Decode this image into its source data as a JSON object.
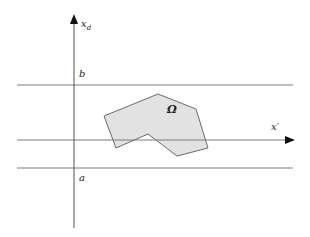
{
  "diagram": {
    "labels": {
      "vertical_axis": "x",
      "vertical_axis_sub": "d",
      "horizontal_axis": "x′",
      "upper_bound": "b",
      "lower_bound": "a",
      "region": "Ω"
    },
    "colors": {
      "line": "#7a7a7a",
      "axis": "#555555",
      "arrow": "#111111",
      "region_fill": "#e2e2e2",
      "region_stroke": "#6a6a6a"
    },
    "lines": {
      "upper_y": 85,
      "axis_y": 140,
      "lower_y": 168,
      "vertical_x": 74
    },
    "region_vertices": [
      [
        104,
        116
      ],
      [
        158,
        94
      ],
      [
        196,
        109
      ],
      [
        208,
        148
      ],
      [
        177,
        156
      ],
      [
        148,
        134
      ],
      [
        116,
        148
      ]
    ]
  }
}
